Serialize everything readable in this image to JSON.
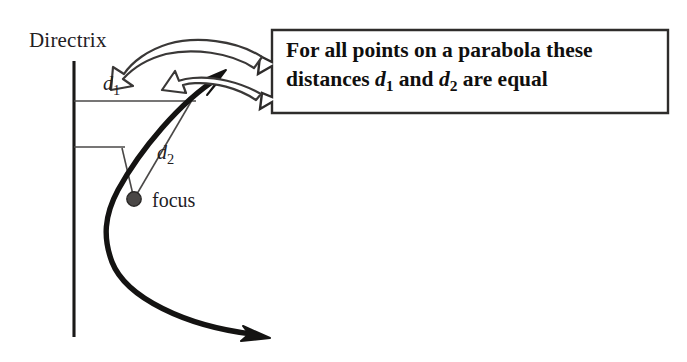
{
  "figure": {
    "background_color": "#ffffff",
    "ink_color": "#1a1918",
    "thin_line_color": "#4a4847"
  },
  "labels": {
    "directrix": "Directrix",
    "focus": "focus",
    "d1": "d",
    "d1_sub": "1",
    "d2": "d",
    "d2_sub": "2"
  },
  "callout": {
    "line1_a": "For all points on a parabola these",
    "line2_a": "distances ",
    "line2_d1": "d",
    "line2_d1_sub": "1",
    "line2_b": " and ",
    "line2_d2": "d",
    "line2_d2_sub": "2",
    "line2_c": " are equal"
  },
  "geometry": {
    "directrix_line": {
      "x": 74,
      "y1": 61,
      "y2": 337
    },
    "d1_segment": {
      "x1": 74,
      "y1": 101,
      "x2": 195,
      "y2": 101
    },
    "d2_segment_top": {
      "x1": 74,
      "y1": 147,
      "x2": 124,
      "y2": 147
    },
    "focus_point": {
      "cx": 134,
      "cy": 199,
      "r": 7
    },
    "parabola_vertex": {
      "x": 104,
      "y": 222
    },
    "parabola_upper_arrow_tip": {
      "x": 224,
      "y": 72
    },
    "parabola_lower_arrow_tip": {
      "x": 266,
      "y": 336
    },
    "callout_box": {
      "x": 272,
      "y": 30,
      "width": 396,
      "height": 84
    }
  }
}
